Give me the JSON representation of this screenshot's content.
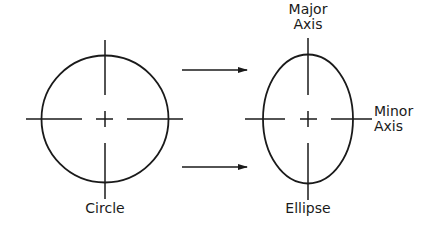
{
  "labels": {
    "circle": "Circle",
    "ellipse": "Ellipse",
    "major_axis": "Major\nAxis",
    "minor_axis": "Minor\nAxis"
  },
  "colors": {
    "stroke": "#1a1a1a",
    "background": "#ffffff"
  }
}
